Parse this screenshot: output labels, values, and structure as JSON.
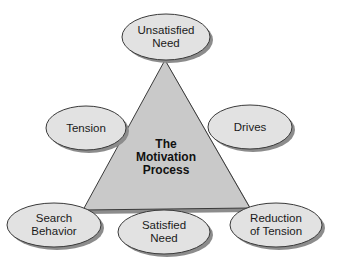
{
  "diagram": {
    "title_lines": [
      "The",
      "Motivation",
      "Process"
    ],
    "colors": {
      "triangle_fill": "#c9c9c9",
      "ellipse_fill": "#e2e2e2",
      "stroke": "#3a3a3a",
      "shadow": "#8c8c8c",
      "background": "#ffffff"
    },
    "nodes": [
      {
        "id": "unsatisfied-need",
        "lines": [
          "Unsatisfied",
          "Need"
        ]
      },
      {
        "id": "tension",
        "lines": [
          "Tension"
        ]
      },
      {
        "id": "drives",
        "lines": [
          "Drives"
        ]
      },
      {
        "id": "search-behavior",
        "lines": [
          "Search",
          "Behavior"
        ]
      },
      {
        "id": "satisfied-need",
        "lines": [
          "Satisfied",
          "Need"
        ]
      },
      {
        "id": "reduction-of-tension",
        "lines": [
          "Reduction",
          "of Tension"
        ]
      }
    ]
  }
}
